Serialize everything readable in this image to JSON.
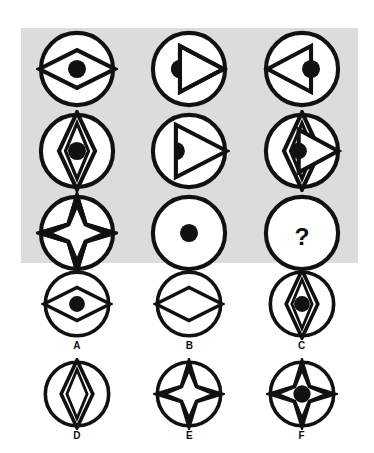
{
  "puzzle": {
    "type": "visual-analogy-matrix",
    "title_text": "",
    "panel_background_color": "#dcdcdc",
    "page_background_color": "#ffffff",
    "ink_color": "#111111",
    "matrix": {
      "rows": 3,
      "columns": 3,
      "cells": [
        {
          "position": "row1-col1",
          "figure_name": "circle-horizontal-diamond-dot",
          "description": "Circle containing a wide horizontal diamond outline with a filled dot at center",
          "elements": [
            "circle",
            "horizontal-diamond",
            "center-dot"
          ]
        },
        {
          "position": "row1-col2",
          "figure_name": "circle-right-triangle-halfdot",
          "description": "Circle containing a right-pointing triangle with a half dot on its left edge",
          "elements": [
            "circle",
            "right-triangle",
            "left-edge-half-dot"
          ]
        },
        {
          "position": "row1-col3",
          "figure_name": "circle-left-triangle-halfdot",
          "description": "Circle containing a left-pointing triangle with a half dot on its right edge",
          "elements": [
            "circle",
            "left-triangle",
            "right-edge-half-dot"
          ]
        },
        {
          "position": "row2-col1",
          "figure_name": "circle-vertical-diamond-dot",
          "description": "Circle containing a tall vertical double diamond outline with a filled dot at center",
          "elements": [
            "circle",
            "vertical-diamond",
            "center-dot"
          ]
        },
        {
          "position": "row2-col2",
          "figure_name": "circle-right-triangle-halfdot-large",
          "description": "Circle containing a large right-pointing triangle with a half dot on its left edge",
          "elements": [
            "circle",
            "right-triangle",
            "left-edge-half-dot"
          ]
        },
        {
          "position": "row2-col3",
          "figure_name": "circle-vertical-diamond-right-triangle-halfdot",
          "description": "Circle containing a vertical diamond overlaid with a right-pointing triangle and a half dot",
          "elements": [
            "circle",
            "vertical-diamond",
            "right-triangle",
            "half-dot"
          ]
        },
        {
          "position": "row3-col1",
          "figure_name": "circle-four-point-star",
          "description": "Circle containing a four-pointed star with an open octagonal center, no dot",
          "elements": [
            "circle",
            "four-point-star"
          ]
        },
        {
          "position": "row3-col2",
          "figure_name": "circle-dot",
          "description": "Plain circle with a filled dot at center",
          "elements": [
            "circle",
            "center-dot"
          ]
        },
        {
          "position": "row3-col3",
          "figure_name": "circle-question-mark",
          "description": "Circle containing a question mark indicating the missing tile",
          "elements": [
            "circle",
            "question-mark"
          ],
          "question_mark": "?"
        }
      ]
    },
    "options": {
      "count": 6,
      "items": [
        {
          "label": "A",
          "figure_name": "circle-horizontal-diamond-dot",
          "description": "Circle with horizontal diamond and filled center dot",
          "elements": [
            "circle",
            "horizontal-diamond",
            "center-dot"
          ]
        },
        {
          "label": "B",
          "figure_name": "circle-horizontal-diamond",
          "description": "Circle with horizontal diamond, no dot",
          "elements": [
            "circle",
            "horizontal-diamond"
          ]
        },
        {
          "label": "C",
          "figure_name": "circle-vertical-diamond-dot",
          "description": "Circle with vertical diamond and filled center dot",
          "elements": [
            "circle",
            "vertical-diamond",
            "center-dot"
          ]
        },
        {
          "label": "D",
          "figure_name": "circle-vertical-diamond",
          "description": "Circle with vertical diamond, no dot",
          "elements": [
            "circle",
            "vertical-diamond"
          ]
        },
        {
          "label": "E",
          "figure_name": "circle-four-point-star",
          "description": "Circle with four-pointed star, open center, no dot",
          "elements": [
            "circle",
            "four-point-star"
          ]
        },
        {
          "label": "F",
          "figure_name": "circle-four-point-star-dot",
          "description": "Circle with four-pointed star and filled center dot",
          "elements": [
            "circle",
            "four-point-star",
            "center-dot"
          ]
        }
      ]
    }
  }
}
